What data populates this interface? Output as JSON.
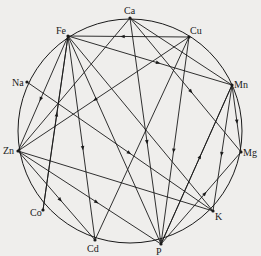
{
  "diagram": {
    "type": "element-interaction-circle",
    "circle": {
      "cx": 130,
      "cy": 131,
      "r": 112
    },
    "colors": {
      "line": "#1a1a1a",
      "background": "#efeeec"
    },
    "nodes": [
      {
        "id": "Ca",
        "label": "Ca",
        "x": 130,
        "y": 18,
        "lx": 124,
        "ly": 14
      },
      {
        "id": "Fe",
        "label": "Fe",
        "x": 68,
        "y": 36,
        "lx": 56,
        "ly": 34
      },
      {
        "id": "Cu",
        "label": "Cu",
        "x": 189,
        "y": 37,
        "lx": 190,
        "ly": 34
      },
      {
        "id": "Na",
        "label": "Na",
        "x": 27,
        "y": 82,
        "lx": 12,
        "ly": 86
      },
      {
        "id": "Mn",
        "label": "Mn",
        "x": 232,
        "y": 85,
        "lx": 234,
        "ly": 88
      },
      {
        "id": "Zn",
        "label": "Zn",
        "x": 18,
        "y": 151,
        "lx": 3,
        "ly": 154
      },
      {
        "id": "Mg",
        "label": "Mg",
        "x": 241,
        "y": 152,
        "lx": 243,
        "ly": 156
      },
      {
        "id": "Co",
        "label": "Co",
        "x": 43,
        "y": 210,
        "lx": 30,
        "ly": 216
      },
      {
        "id": "K",
        "label": "K",
        "x": 213,
        "y": 211,
        "lx": 215,
        "ly": 220
      },
      {
        "id": "Cd",
        "label": "Cd",
        "x": 95,
        "y": 240,
        "lx": 87,
        "ly": 252
      },
      {
        "id": "P",
        "label": "P",
        "x": 161,
        "y": 244,
        "lx": 156,
        "ly": 255
      }
    ],
    "edges": [
      {
        "from": "Cu",
        "to": "Fe",
        "arrow": true
      },
      {
        "from": "Fe",
        "to": "Mn",
        "arrow": true
      },
      {
        "from": "Fe",
        "to": "Zn",
        "arrow": true
      },
      {
        "from": "Fe",
        "to": "Co",
        "arrow": false
      },
      {
        "from": "Fe",
        "to": "P",
        "arrow": false
      },
      {
        "from": "Fe",
        "to": "K",
        "arrow": false
      },
      {
        "from": "Fe",
        "to": "Cd",
        "arrow": true
      },
      {
        "from": "Ca",
        "to": "Zn",
        "arrow": false
      },
      {
        "from": "Ca",
        "to": "Mn",
        "arrow": false
      },
      {
        "from": "Ca",
        "to": "P",
        "arrow": true
      },
      {
        "from": "Ca",
        "to": "Mg",
        "arrow": true
      },
      {
        "from": "Cu",
        "to": "Zn",
        "arrow": true
      },
      {
        "from": "Cu",
        "to": "P",
        "arrow": true
      },
      {
        "from": "Cu",
        "to": "Cd",
        "arrow": false
      },
      {
        "from": "Na",
        "to": "K",
        "arrow": true
      },
      {
        "from": "Mn",
        "to": "P",
        "arrow": false
      },
      {
        "from": "Mn",
        "to": "K",
        "arrow": true
      },
      {
        "from": "Mn",
        "to": "Mg",
        "arrow": true
      },
      {
        "from": "Zn",
        "to": "Cd",
        "arrow": true
      },
      {
        "from": "Zn",
        "to": "P",
        "arrow": true
      },
      {
        "from": "Zn",
        "to": "K",
        "arrow": false
      },
      {
        "from": "Co",
        "to": "Fe",
        "arrow": true
      },
      {
        "from": "P",
        "to": "Mg",
        "arrow": true
      },
      {
        "from": "P",
        "to": "Mn",
        "arrow": true
      }
    ]
  }
}
